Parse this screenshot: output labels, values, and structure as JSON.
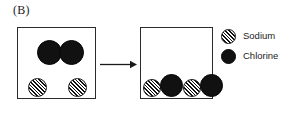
{
  "figure": {
    "panel_label": "(B)"
  },
  "legend": {
    "items": [
      {
        "label": "Sodium",
        "swatch": "hatched-circle",
        "icon_name": "sodium-atom-icon",
        "color": "#111111",
        "fill_style": "diagonal-hatch"
      },
      {
        "label": "Chlorine",
        "swatch": "solid-circle",
        "icon_name": "chlorine-atom-icon",
        "color": "#111111",
        "fill_style": "solid"
      }
    ]
  },
  "reactants_box": {
    "name": "reactants-container",
    "atoms": [
      {
        "species": "Chlorine",
        "kind": "chlorine",
        "x": 37,
        "y": 40,
        "d": 25
      },
      {
        "species": "Chlorine",
        "kind": "chlorine",
        "x": 59,
        "y": 40,
        "d": 25
      },
      {
        "species": "Sodium",
        "kind": "sodium",
        "x": 28,
        "y": 78,
        "d": 19
      },
      {
        "species": "Sodium",
        "kind": "sodium",
        "x": 68,
        "y": 78,
        "d": 19
      }
    ]
  },
  "products_box": {
    "name": "products-container",
    "atoms": [
      {
        "species": "Sodium",
        "kind": "sodium",
        "x": 143,
        "y": 79,
        "d": 18
      },
      {
        "species": "Chlorine",
        "kind": "chlorine",
        "x": 160,
        "y": 74,
        "d": 23
      },
      {
        "species": "Sodium",
        "kind": "sodium",
        "x": 183,
        "y": 79,
        "d": 18
      },
      {
        "species": "Chlorine",
        "kind": "chlorine",
        "x": 200,
        "y": 74,
        "d": 23
      }
    ]
  },
  "arrow": {
    "name": "reaction-arrow",
    "direction": "right",
    "color": "#1a1a1a"
  }
}
